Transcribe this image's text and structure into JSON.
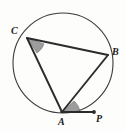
{
  "figure": {
    "width": 125,
    "height": 131,
    "background_color": "#fdfdfc",
    "stroke_color": "#2b2b2b",
    "angle_fill_color": "#8c8c8c"
  },
  "circle": {
    "name": "circumscribed-circle",
    "center_x": 63,
    "center_y": 63,
    "radius": 50,
    "stroke_color": "#3a3a3a",
    "stroke_width": 1.1
  },
  "points": [
    {
      "id": "C",
      "label": "C",
      "x": 27,
      "y": 38,
      "label_x": 11,
      "label_y": 26,
      "on_circle": true,
      "marker": "none"
    },
    {
      "id": "B",
      "label": "B",
      "x": 108,
      "y": 55,
      "label_x": 112,
      "label_y": 47,
      "on_circle": true,
      "marker": "none"
    },
    {
      "id": "A",
      "label": "A",
      "x": 62,
      "y": 112,
      "label_x": 58,
      "label_y": 117,
      "on_circle": true,
      "marker": "none"
    },
    {
      "id": "P",
      "label": "P",
      "x": 94,
      "y": 112,
      "label_x": 96,
      "label_y": 114,
      "on_circle": false,
      "marker": "dot"
    }
  ],
  "segments": [
    {
      "id": "CB",
      "name": "chord-c-b",
      "from": "C",
      "to": "B"
    },
    {
      "id": "CA",
      "name": "chord-c-a",
      "from": "C",
      "to": "A"
    },
    {
      "id": "AB",
      "name": "chord-a-b",
      "from": "A",
      "to": "B"
    },
    {
      "id": "AP",
      "name": "tangent-a-p",
      "from": "A",
      "to": "P"
    }
  ],
  "angle_marks": [
    {
      "id": "angle-ACB",
      "name": "angle-mark-at-c",
      "vertex": "C",
      "description": "inscribed angle ACB shaded"
    },
    {
      "id": "angle-BAP",
      "name": "angle-mark-at-a",
      "vertex": "A",
      "description": "tangent-chord angle BAP shaded"
    }
  ],
  "ghost_watermarks": [
    {
      "text": "",
      "x": 58,
      "y": 30
    },
    {
      "text": "",
      "x": 14,
      "y": 52
    },
    {
      "text": "",
      "x": 20,
      "y": 72
    }
  ]
}
